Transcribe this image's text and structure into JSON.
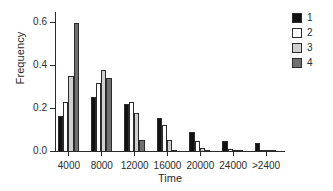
{
  "chart_data": {
    "type": "bar",
    "title": "",
    "xlabel": "Time",
    "ylabel": "Frequency",
    "categories": [
      "4000",
      "8000",
      "12000",
      "16000",
      "20000",
      "24000",
      ">2400"
    ],
    "ylim": [
      0.0,
      0.65
    ],
    "ytick_labels": [
      "0.0",
      "0.2",
      "0.4",
      "0.6"
    ],
    "ytick_values": [
      0.0,
      0.2,
      0.4,
      0.6
    ],
    "grid": false,
    "legend_position": "right",
    "series": [
      {
        "name": "1",
        "color": "#111111",
        "values": [
          0.165,
          0.255,
          0.222,
          0.16,
          0.092,
          0.05,
          0.04
        ]
      },
      {
        "name": "2",
        "color": "#ffffff",
        "values": [
          0.23,
          0.321,
          0.231,
          0.125,
          0.05,
          0.015,
          0.008
        ]
      },
      {
        "name": "3",
        "color": "#cfcfcf",
        "values": [
          0.355,
          0.379,
          0.181,
          0.056,
          0.018,
          0.008,
          0.004
        ]
      },
      {
        "name": "4",
        "color": "#707070",
        "values": [
          0.6,
          0.342,
          0.055,
          0.005,
          0.004,
          0.003,
          0.002
        ]
      }
    ]
  },
  "legend": {
    "entries": [
      {
        "label": "1",
        "color": "#111111"
      },
      {
        "label": "2",
        "color": "#ffffff"
      },
      {
        "label": "3",
        "color": "#cfcfcf"
      },
      {
        "label": "4",
        "color": "#707070"
      }
    ]
  }
}
